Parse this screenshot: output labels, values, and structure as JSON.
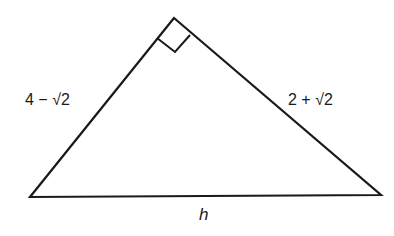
{
  "diagram": {
    "type": "right-triangle",
    "stroke_color": "#1a1a1a",
    "vertices": {
      "apex": [
        174,
        18
      ],
      "bottom_left": [
        30,
        197
      ],
      "bottom_right": [
        381,
        195
      ]
    },
    "right_angle_marker": {
      "at_vertex": "apex",
      "points": [
        [
          157,
          38
        ],
        [
          175,
          52
        ],
        [
          190,
          35
        ]
      ]
    },
    "labels": {
      "left_leg": "4 − √2",
      "right_leg": "2 + √2",
      "hypotenuse": "h"
    }
  }
}
